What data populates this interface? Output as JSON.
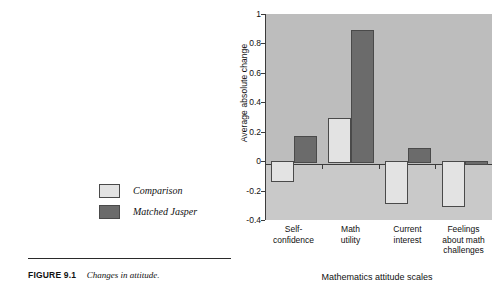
{
  "figure": {
    "caption_label": "FIGURE 9.1",
    "caption_text": "Changes in attitude."
  },
  "legend": {
    "position": "left-outside",
    "items": [
      {
        "label": "Comparison",
        "color": "#e3e3e3",
        "swatch": "comparison-swatch"
      },
      {
        "label": "Matched Jasper",
        "color": "#6b6b6b",
        "swatch": "matched-jasper-swatch"
      }
    ]
  },
  "chart_data": {
    "type": "bar",
    "title": "",
    "subtitle": "",
    "xlabel": "Mathematics attitude scales",
    "ylabel": "Average absolute change",
    "ylim": [
      -0.4,
      1
    ],
    "yticks": [
      1,
      0.8,
      0.6,
      0.4,
      0.2,
      0,
      -0.2,
      -0.4
    ],
    "ytick_labels": [
      "1",
      "0.8",
      "0.6",
      "0.4",
      "0.2",
      "0",
      "-0.2",
      "-0.4"
    ],
    "grid": false,
    "legend_position": "left-outside",
    "categories": [
      "Self-\nconfidence",
      "Math\nutility",
      "Current\ninterest",
      "Feelings\nabout math\nchallenges"
    ],
    "category_lines": [
      [
        "Self-",
        "confidence"
      ],
      [
        "Math",
        "utility"
      ],
      [
        "Current",
        "interest"
      ],
      [
        "Feelings",
        "about math",
        "challenges"
      ]
    ],
    "series": [
      {
        "name": "Comparison",
        "color": "#e3e3e3",
        "values": [
          -0.13,
          0.29,
          -0.28,
          -0.3
        ]
      },
      {
        "name": "Matched Jasper",
        "color": "#6b6b6b",
        "values": [
          0.17,
          0.89,
          0.09,
          -0.01
        ]
      }
    ]
  }
}
